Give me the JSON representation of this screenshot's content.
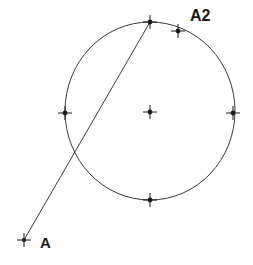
{
  "canvas": {
    "width": 253,
    "height": 265,
    "background": "#ffffff",
    "stroke_color": "#3a3a3a",
    "marker_color": "#1a1a1a",
    "label_color": "#1a1a1a"
  },
  "diagram": {
    "labels": [
      {
        "name": "point-a-label",
        "text": "A",
        "x": 40,
        "y": 248,
        "font_size": 15
      },
      {
        "name": "point-a2-label",
        "text": "A2",
        "x": 190,
        "y": 21,
        "font_size": 16
      }
    ],
    "circle": {
      "name": "main-circle",
      "cx": 150,
      "cy": 111,
      "rx": 85,
      "ry": 89,
      "stroke_width": 1
    },
    "line": {
      "name": "secant-line",
      "x1": 24,
      "y1": 240,
      "x2": 150,
      "y2": 22,
      "stroke_width": 1
    },
    "markers": [
      {
        "name": "marker-point-a",
        "x": 24,
        "y": 240,
        "arm": 7,
        "dot": 2.1
      },
      {
        "name": "marker-circle-top",
        "x": 150,
        "y": 22,
        "arm": 7,
        "dot": 2.4
      },
      {
        "name": "marker-point-a2",
        "x": 178,
        "y": 31,
        "arm": 7,
        "dot": 2.4
      },
      {
        "name": "marker-circle-left",
        "x": 65,
        "y": 113,
        "arm": 7,
        "dot": 2.4
      },
      {
        "name": "marker-circle-center",
        "x": 150,
        "y": 112,
        "arm": 7,
        "dot": 2.4
      },
      {
        "name": "marker-circle-right",
        "x": 233,
        "y": 113,
        "arm": 7,
        "dot": 2.4
      },
      {
        "name": "marker-circle-bottom",
        "x": 150,
        "y": 200,
        "arm": 7,
        "dot": 2.4
      }
    ]
  }
}
